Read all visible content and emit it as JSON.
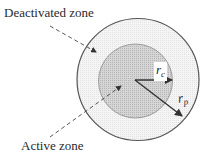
{
  "diagram": {
    "type": "concentric-circle-zones",
    "labels": {
      "deactivated_zone": "Deactivated zone",
      "active_zone": "Active zone"
    },
    "radii": {
      "core": {
        "symbol": "r",
        "subscript": "c"
      },
      "particle": {
        "symbol": "r",
        "subscript": "p"
      }
    },
    "colors": {
      "outer_zone_fill": "#f2f2f2",
      "inner_zone_fill": "#cfcfcf",
      "stroke": "#555555",
      "text": "#2a2a2a"
    }
  }
}
